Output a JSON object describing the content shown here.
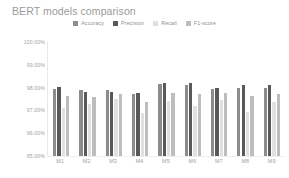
{
  "chart_data": {
    "type": "bar",
    "title": "BERT models comparison",
    "xlabel": "",
    "ylabel": "",
    "ylim": [
      95.0,
      100.0
    ],
    "ytick_labels": [
      "100.00%",
      "99.00%",
      "98.00%",
      "97.00%",
      "96.00%",
      "95.00%"
    ],
    "ytick_values": [
      100.0,
      99.0,
      98.0,
      97.0,
      96.0,
      95.0
    ],
    "grid": false,
    "legend_position": "top-center",
    "categories": [
      "M1",
      "M2",
      "M3",
      "M4",
      "M5",
      "M6",
      "M7",
      "M8",
      "M9"
    ],
    "series": [
      {
        "name": "Accuracy",
        "color": "#8c8c8c",
        "values": [
          97.92,
          97.88,
          97.9,
          97.72,
          98.18,
          98.12,
          97.95,
          98.0,
          97.98
        ]
      },
      {
        "name": "Precision",
        "color": "#595959",
        "values": [
          98.02,
          97.82,
          97.8,
          97.76,
          98.22,
          98.2,
          98.0,
          98.12,
          98.1
        ]
      },
      {
        "name": "Recall",
        "color": "#e0e0e0",
        "values": [
          97.12,
          97.3,
          97.48,
          96.9,
          97.4,
          97.2,
          97.45,
          96.95,
          97.35
        ]
      },
      {
        "name": "F1-score",
        "color": "#bdbdbd",
        "values": [
          97.62,
          97.6,
          97.7,
          97.35,
          97.78,
          97.72,
          97.75,
          97.62,
          97.7
        ]
      }
    ]
  },
  "colors": {
    "title": "#9a9a9a",
    "axis_label": "#a3a3a3",
    "axis_line": "#e8e8e8",
    "background": "#ffffff"
  }
}
